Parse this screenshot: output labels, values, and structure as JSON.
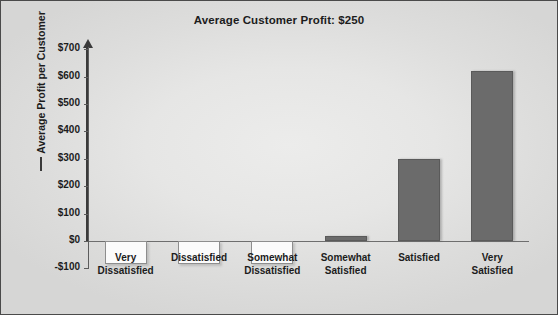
{
  "chart_data": {
    "type": "bar",
    "title": "Average Customer Profit: $250",
    "xlabel": "",
    "ylabel": "Average Profit per Customer",
    "categories": [
      "Very Dissatisfied",
      "Dissatisfied",
      "Somewhat Dissatisfied",
      "Somewhat Satisfied",
      "Satisfied",
      "Very Satisfied"
    ],
    "category_lines": [
      [
        "Very",
        "Dissatisfied"
      ],
      [
        "Dissatisfied",
        ""
      ],
      [
        "Somewhat",
        "Dissatisfied"
      ],
      [
        "Somewhat",
        "Satisfied"
      ],
      [
        "Satisfied",
        ""
      ],
      [
        "Very",
        "Satisfied"
      ]
    ],
    "values": [
      -85,
      -85,
      -85,
      20,
      300,
      620
    ],
    "ylim": [
      -100,
      700
    ],
    "ytick_values": [
      700,
      600,
      500,
      400,
      300,
      200,
      100,
      0,
      -100
    ],
    "ytick_labels": [
      "$700",
      "$600",
      "$500",
      "$400",
      "$300",
      "$200",
      "$100",
      "$0",
      "-$100"
    ],
    "grid": false,
    "legend": "none",
    "bar_colors": {
      "positive": "#6b6b6b",
      "negative": "#fbfbfb",
      "negative_border": "#8e8e8e"
    },
    "axis_color": "#3a3a3a",
    "background": "#e6e6e5"
  }
}
